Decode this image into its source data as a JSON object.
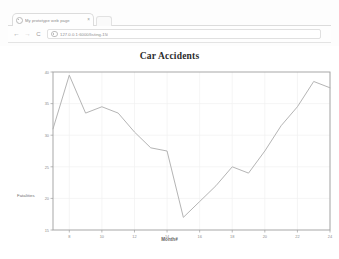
{
  "browser": {
    "tab": {
      "title": "My prototype web page",
      "favicon_icon": "globe-icon",
      "close_icon": "×"
    },
    "new_tab_icon": "new-tab-icon",
    "nav": {
      "back_icon": "←",
      "forward_icon": "→",
      "reload_icon": "C"
    },
    "omnibox": {
      "url": "127.0.0.1:6000/listing-15/",
      "site_info_icon": "info-icon"
    }
  },
  "chart_data": {
    "type": "line",
    "title": "Car Accidents",
    "xlabel": "Month#",
    "ylabel": "Fatalities",
    "xlim": [
      7,
      24
    ],
    "ylim": [
      15,
      40
    ],
    "xticks": [
      8,
      10,
      12,
      14,
      16,
      18,
      20,
      22,
      24
    ],
    "xtick_labels": [
      "8",
      "10",
      "12",
      "14",
      "16",
      "18",
      "20",
      "22",
      "24"
    ],
    "yticks": [
      15,
      20,
      25,
      30,
      35,
      40
    ],
    "ytick_labels": [
      "15",
      "20",
      "25",
      "30",
      "35",
      "40"
    ],
    "grid": true,
    "legend": null,
    "line_color": "#b0b0b0",
    "x": [
      7,
      8,
      9,
      10,
      11,
      12,
      13,
      14,
      15,
      16,
      17,
      18,
      19,
      20,
      21,
      22,
      23,
      24
    ],
    "series": [
      {
        "name": "Fatalities",
        "values": [
          31.0,
          39.5,
          33.5,
          34.5,
          33.5,
          30.5,
          28.0,
          27.5,
          17.0,
          19.5,
          22.0,
          25.0,
          24.0,
          27.5,
          31.5,
          34.5,
          38.5,
          37.5
        ]
      }
    ]
  }
}
